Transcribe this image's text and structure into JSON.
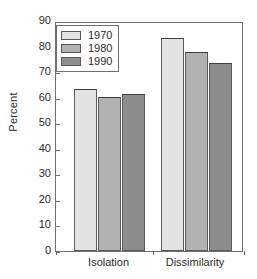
{
  "chart_data": {
    "type": "bar",
    "title": "",
    "xlabel": "",
    "ylabel": "Percent",
    "ylim": [
      0,
      90
    ],
    "ytick_step": 10,
    "yticks": [
      0,
      10,
      20,
      30,
      40,
      50,
      60,
      70,
      80,
      90
    ],
    "grid": false,
    "legend_position": "upper-left-inside",
    "categories": [
      "Isolation",
      "Dissimilarity"
    ],
    "series": [
      {
        "name": "1970",
        "color": "#e2e2e2",
        "values": [
          63.5,
          83.5
        ]
      },
      {
        "name": "1980",
        "color": "#b2b2b2",
        "values": [
          60.2,
          78.0
        ]
      },
      {
        "name": "1990",
        "color": "#8d8d8d",
        "values": [
          61.5,
          73.5
        ]
      }
    ]
  },
  "legend": {
    "items": [
      {
        "label": "1970"
      },
      {
        "label": "1980"
      },
      {
        "label": "1990"
      }
    ]
  },
  "axes": {
    "y_title": "Percent",
    "y_tick_labels": [
      "90",
      "80",
      "70",
      "60",
      "50",
      "40",
      "30",
      "20",
      "10",
      "0"
    ],
    "x_tick_labels": [
      "Isolation",
      "Dissimilarity"
    ]
  },
  "colors": {
    "series_1970": "#e2e2e2",
    "series_1980": "#b2b2b2",
    "series_1990": "#8d8d8d",
    "frame": "#6f6f6f",
    "bar_outline": "#5a5a5a",
    "text": "#2b2b2b",
    "background": "#ffffff"
  }
}
